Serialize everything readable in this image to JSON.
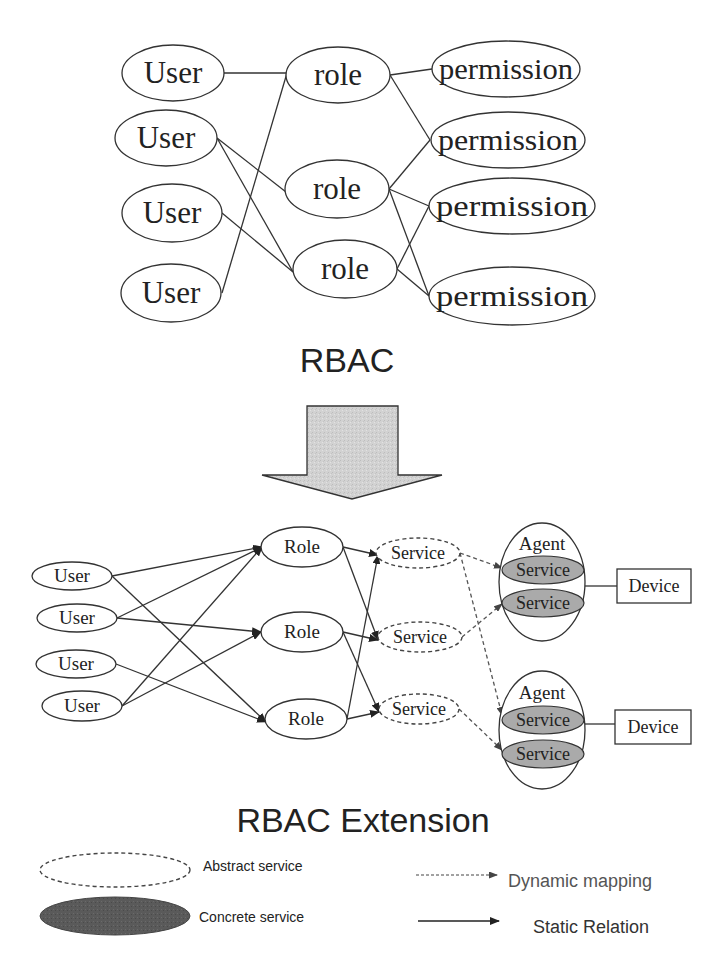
{
  "top": {
    "title": "RBAC",
    "users": [
      {
        "label": "User",
        "cx": 173,
        "cy": 73,
        "rx": 51,
        "ry": 28
      },
      {
        "label": "User",
        "cx": 166,
        "cy": 138,
        "rx": 51,
        "ry": 28
      },
      {
        "label": "User",
        "cx": 172,
        "cy": 213,
        "rx": 50,
        "ry": 29
      },
      {
        "label": "User",
        "cx": 171,
        "cy": 293,
        "rx": 50,
        "ry": 29
      }
    ],
    "roles": [
      {
        "label": "role",
        "cx": 338,
        "cy": 75,
        "rx": 52,
        "ry": 28
      },
      {
        "label": "role",
        "cx": 337,
        "cy": 189,
        "rx": 52,
        "ry": 29
      },
      {
        "label": "role",
        "cx": 345,
        "cy": 269,
        "rx": 52,
        "ry": 29
      }
    ],
    "permissions": [
      {
        "label": "permission",
        "cx": 506,
        "cy": 69,
        "rx": 74,
        "ry": 28
      },
      {
        "label": "permission",
        "cx": 508,
        "cy": 140,
        "rx": 77,
        "ry": 28
      },
      {
        "label": "permission",
        "cx": 512,
        "cy": 206,
        "rx": 83,
        "ry": 28
      },
      {
        "label": "permission",
        "cx": 512,
        "cy": 296,
        "rx": 83,
        "ry": 29
      }
    ],
    "edges": [
      [
        224,
        73,
        287,
        73
      ],
      [
        222,
        293,
        287,
        73
      ],
      [
        217,
        138,
        286,
        192
      ],
      [
        217,
        138,
        293,
        272
      ],
      [
        222,
        213,
        293,
        272
      ],
      [
        390,
        75,
        432,
        69
      ],
      [
        390,
        75,
        430,
        140
      ],
      [
        389,
        189,
        430,
        140
      ],
      [
        389,
        189,
        429,
        206
      ],
      [
        389,
        189,
        429,
        296
      ],
      [
        397,
        269,
        429,
        206
      ],
      [
        397,
        269,
        429,
        296
      ]
    ]
  },
  "arrow": {
    "shaft_left": 307,
    "shaft_right": 398,
    "top": 406,
    "shaft_bottom": 475,
    "head_left": 262,
    "head_right": 442,
    "tip_x": 352,
    "tip_y": 499,
    "fill": "#d4d4d4"
  },
  "bottom": {
    "title": "RBAC Extension",
    "users": [
      {
        "label": "User",
        "cx": 72,
        "cy": 576,
        "rx": 40,
        "ry": 14
      },
      {
        "label": "User",
        "cx": 77,
        "cy": 618,
        "rx": 40,
        "ry": 14
      },
      {
        "label": "User",
        "cx": 76,
        "cy": 664,
        "rx": 40,
        "ry": 14
      },
      {
        "label": "User",
        "cx": 82,
        "cy": 706,
        "rx": 40,
        "ry": 15
      }
    ],
    "roles": [
      {
        "label": "Role",
        "cx": 302,
        "cy": 547,
        "rx": 41,
        "ry": 20
      },
      {
        "label": "Role",
        "cx": 302,
        "cy": 632,
        "rx": 41,
        "ry": 20
      },
      {
        "label": "Role",
        "cx": 306,
        "cy": 719,
        "rx": 41,
        "ry": 20
      }
    ],
    "services": [
      {
        "label": "Service",
        "cx": 418,
        "cy": 553,
        "rx": 42,
        "ry": 15
      },
      {
        "label": "Service",
        "cx": 420,
        "cy": 637,
        "rx": 42,
        "ry": 15
      },
      {
        "label": "Service",
        "cx": 419,
        "cy": 709,
        "rx": 40,
        "ry": 15
      }
    ],
    "agents": [
      {
        "label": "Agent",
        "cx": 542,
        "cy": 582,
        "rx": 43,
        "ry": 59,
        "label_y": 550,
        "services": [
          {
            "label": "Service",
            "cx": 543,
            "cy": 570,
            "rx": 41,
            "ry": 14
          },
          {
            "label": "Service",
            "cx": 543,
            "cy": 603,
            "rx": 41,
            "ry": 14
          }
        ],
        "device": {
          "label": "Device",
          "x": 617,
          "y": 569,
          "w": 74,
          "h": 34
        },
        "link": [
          585,
          586,
          617,
          586
        ]
      },
      {
        "label": "Agent",
        "cx": 542,
        "cy": 730,
        "rx": 43,
        "ry": 59,
        "label_y": 699,
        "services": [
          {
            "label": "Service",
            "cx": 543,
            "cy": 720,
            "rx": 41,
            "ry": 14
          },
          {
            "label": "Service",
            "cx": 543,
            "cy": 754,
            "rx": 41,
            "ry": 14
          }
        ],
        "device": {
          "label": "Device",
          "x": 615,
          "y": 710,
          "w": 76,
          "h": 34
        },
        "link": [
          585,
          724,
          615,
          724
        ]
      }
    ],
    "static_edges": [
      [
        112,
        576,
        262,
        547
      ],
      [
        112,
        576,
        266,
        722
      ],
      [
        117,
        618,
        262,
        547
      ],
      [
        117,
        618,
        261,
        632
      ],
      [
        116,
        664,
        266,
        722
      ],
      [
        122,
        706,
        262,
        547
      ],
      [
        122,
        706,
        261,
        632
      ],
      [
        343,
        547,
        378,
        555
      ],
      [
        343,
        547,
        378,
        640
      ],
      [
        343,
        632,
        378,
        640
      ],
      [
        343,
        632,
        379,
        712
      ],
      [
        347,
        719,
        378,
        555
      ],
      [
        347,
        719,
        379,
        712
      ]
    ],
    "dynamic_edges": [
      [
        460,
        553,
        502,
        568
      ],
      [
        460,
        553,
        502,
        715
      ],
      [
        462,
        637,
        502,
        604
      ],
      [
        459,
        709,
        502,
        750
      ]
    ]
  },
  "legend": {
    "abstract_label": "Abstract service",
    "concrete_label": "Concrete service",
    "dynamic_label": "Dynamic mapping",
    "static_label": "Static Relation"
  }
}
